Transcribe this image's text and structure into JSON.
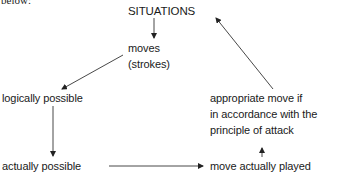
{
  "diagram": {
    "preceding_text": "below:",
    "nodes": {
      "situations": "SITUATIONS",
      "moves_line1": "moves",
      "moves_line2": "(strokes)",
      "logically_possible": "logically possible",
      "actually_possible": "actually possible",
      "move_played": "move actually played",
      "appropriate_line1": "appropriate move if",
      "appropriate_line2": "in accordance with the",
      "appropriate_line3": "principle of attack"
    },
    "edges": [
      {
        "from": "SITUATIONS",
        "to": "moves (strokes)"
      },
      {
        "from": "moves (strokes)",
        "to": "logically possible"
      },
      {
        "from": "logically possible",
        "to": "actually possible"
      },
      {
        "from": "actually possible",
        "to": "move actually played"
      },
      {
        "from": "move actually played",
        "to": "appropriate move if in accordance with the principle of attack"
      },
      {
        "from": "appropriate move if in accordance with the principle of attack",
        "to": "SITUATIONS"
      }
    ]
  }
}
